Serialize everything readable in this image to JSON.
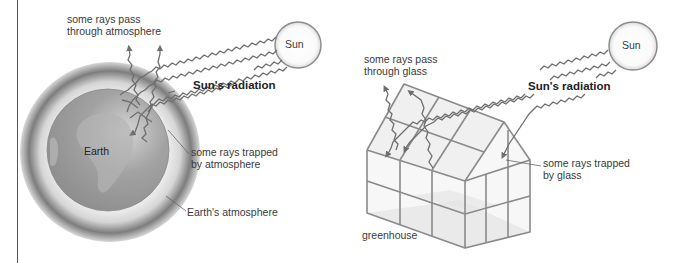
{
  "earth_panel": {
    "labels": {
      "rays_pass_line1": "some rays pass",
      "rays_pass_line2": "through atmosphere",
      "sun": "Sun",
      "radiation": "Sun's radiation",
      "earth": "Earth",
      "rays_trapped_line1": "some rays trapped",
      "rays_trapped_line2": "by atmosphere",
      "atmosphere": "Earth's atmosphere"
    }
  },
  "greenhouse_panel": {
    "labels": {
      "rays_pass_line1": "some rays pass",
      "rays_pass_line2": "through glass",
      "sun": "Sun",
      "radiation": "Sun's radiation",
      "rays_trapped_line1": "some rays trapped",
      "rays_trapped_line2": "by glass",
      "greenhouse": "greenhouse"
    }
  },
  "colors": {
    "line": "#6e6e6e",
    "earth": "#9a9a9a",
    "atmosphere_dark": "#7a7a7a",
    "frame": "#8a8a8a",
    "floor": "#bdbdbd"
  }
}
